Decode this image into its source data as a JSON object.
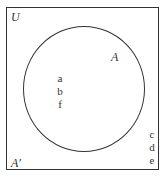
{
  "diagram": {
    "type": "venn",
    "universal_label": "U",
    "set_label": "A",
    "complement_label": "A′",
    "set_elements": [
      "a",
      "b",
      "f"
    ],
    "complement_elements": [
      "c",
      "d",
      "e"
    ],
    "line_color": "#333333"
  }
}
